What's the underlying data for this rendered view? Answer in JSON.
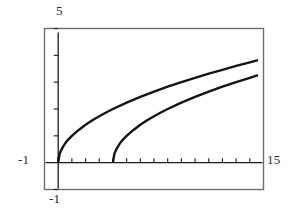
{
  "figure": {
    "kind": "cartesian-plot",
    "background": "#ffffff",
    "line_color": "#141414",
    "frame_color": "#6e6e6e",
    "axis_color": "#1c1c1c"
  },
  "labels": {
    "y_max": "5",
    "y_min": "-1",
    "x_min": "-1",
    "x_max": "15"
  },
  "chart_data": {
    "type": "line",
    "title": "",
    "xlabel": "",
    "ylabel": "",
    "xlim": [
      -1,
      15
    ],
    "ylim": [
      -1,
      5
    ],
    "grid": false,
    "legend": "none",
    "x_ticks": [
      0,
      1,
      2,
      3,
      4,
      5,
      6,
      7,
      8,
      9,
      10,
      11,
      12,
      13,
      14
    ],
    "y_ticks": [
      -1,
      0,
      1,
      2,
      3,
      4,
      5
    ],
    "x_tick_labels": [
      "-1",
      "15"
    ],
    "y_tick_labels": [
      "-1",
      "5"
    ],
    "series": [
      {
        "name": "sqrt(x)",
        "color": "#141414",
        "x": [
          0,
          0.1,
          0.2,
          0.35,
          0.5,
          0.75,
          1,
          1.5,
          2,
          2.5,
          3,
          3.5,
          4,
          5,
          6,
          7,
          8,
          9,
          10,
          11,
          12,
          13,
          14,
          14.6
        ],
        "y": [
          0,
          0.32,
          0.45,
          0.59,
          0.71,
          0.87,
          1.0,
          1.22,
          1.41,
          1.58,
          1.73,
          1.87,
          2.0,
          2.24,
          2.45,
          2.65,
          2.83,
          3.0,
          3.16,
          3.32,
          3.46,
          3.61,
          3.74,
          3.82
        ]
      },
      {
        "name": "sqrt(x-4)",
        "color": "#141414",
        "x": [
          4,
          4.1,
          4.2,
          4.35,
          4.5,
          4.75,
          5,
          5.5,
          6,
          6.5,
          7,
          7.5,
          8,
          9,
          10,
          11,
          12,
          13,
          14,
          14.6
        ],
        "y": [
          0,
          0.32,
          0.45,
          0.59,
          0.71,
          0.87,
          1.0,
          1.22,
          1.41,
          1.58,
          1.73,
          1.87,
          2.0,
          2.24,
          2.45,
          2.65,
          2.83,
          3.0,
          3.16,
          3.26
        ]
      }
    ]
  }
}
